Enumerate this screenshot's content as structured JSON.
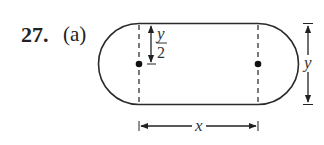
{
  "problem": {
    "number": "27.",
    "part": "(a)"
  },
  "figure": {
    "shape": "stadium (rectangle with semicircular ends)",
    "labels": {
      "half_height_var": "y",
      "half_height_den": "2",
      "height": "y",
      "width": "x"
    },
    "markers": [
      "left-center-dot",
      "right-center-dot"
    ]
  }
}
